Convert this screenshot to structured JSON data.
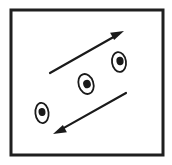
{
  "figure": {
    "background_color": "#ffffff",
    "ink_color": "#1a1a1a",
    "frame": {
      "name": "outer-rectangle-border",
      "x": 11,
      "y": 10,
      "width": 152,
      "height": 145,
      "stroke_width": 3,
      "stroke_color": "#1f1f1f",
      "fill": "#ffffff"
    },
    "arrows": [
      {
        "id": "upper-arrow",
        "label": "upper arrow pointing up-right",
        "direction": "up-right",
        "tail_x": 50,
        "tail_y": 73,
        "head_x": 124,
        "head_y": 31,
        "stroke_width": 2.2,
        "head_length": 13,
        "head_width": 7
      },
      {
        "id": "lower-arrow",
        "label": "lower arrow pointing down-left",
        "direction": "down-left",
        "tail_x": 126,
        "tail_y": 93,
        "head_x": 53,
        "head_y": 134,
        "stroke_width": 2.2,
        "head_length": 13,
        "head_width": 7
      }
    ],
    "ovals": [
      {
        "id": "oval-top-right",
        "label": "top-right oval particle",
        "cx": 119,
        "cy": 62,
        "rx": 7.0,
        "ry": 10.0,
        "rotation": -8,
        "outline_width": 1.8,
        "blob_cx": 120,
        "blob_cy": 61,
        "blob_rx": 3.6,
        "blob_ry": 4.2
      },
      {
        "id": "oval-center",
        "label": "center oval particle",
        "cx": 86,
        "cy": 84,
        "rx": 7.4,
        "ry": 10.2,
        "rotation": -18,
        "outline_width": 1.8,
        "blob_cx": 87,
        "blob_cy": 84,
        "blob_rx": 3.8,
        "blob_ry": 4.2
      },
      {
        "id": "oval-bottom-left",
        "label": "bottom-left oval particle",
        "cx": 42,
        "cy": 113,
        "rx": 6.6,
        "ry": 10.2,
        "rotation": -6,
        "outline_width": 1.8,
        "blob_cx": 42,
        "blob_cy": 112,
        "blob_rx": 3.5,
        "blob_ry": 4.0
      }
    ]
  }
}
